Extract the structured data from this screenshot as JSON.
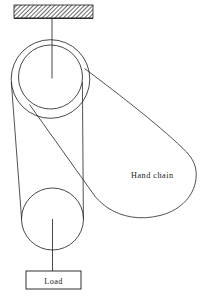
{
  "diagram": {
    "type": "mechanical-schematic",
    "background_color": "#ffffff",
    "line_color": "#1a1a1a",
    "labels": {
      "hand_chain": "Hand chain",
      "load": "Load"
    },
    "parts": {
      "ceiling_support": {
        "name": "hatched-ceiling-support",
        "x": 14,
        "y": 5,
        "width": 79,
        "height": 13,
        "hatch": "diagonal"
      },
      "hanger_rod": {
        "name": "hanger-rod",
        "x1": 52,
        "y1": 18,
        "x2": 52,
        "y2": 78
      },
      "upper_pulley_outer": {
        "name": "upper-pulley-outer-circle",
        "cx": 50.5,
        "cy": 79,
        "r": 39.5
      },
      "upper_pulley_inner": {
        "name": "upper-pulley-inner-circle",
        "cx": 50.5,
        "cy": 77,
        "r": 32
      },
      "lower_pulley": {
        "name": "lower-pulley-circle",
        "cx": 52.5,
        "cy": 219,
        "r": 31
      },
      "load_rod": {
        "name": "load-rod",
        "x1": 52.5,
        "y1": 219,
        "x2": 52.5,
        "y2": 271
      },
      "load_box": {
        "name": "load-box",
        "x": 26,
        "y": 271,
        "width": 55,
        "height": 18
      },
      "hand_chain_loop": {
        "name": "hand-chain-loop",
        "right_extent_x": 197,
        "bottom_extent_y": 217
      }
    },
    "label_positions": {
      "hand_chain": {
        "x": 131,
        "y": 178
      },
      "load": {
        "x": 53.5,
        "y": 283.5
      }
    }
  }
}
